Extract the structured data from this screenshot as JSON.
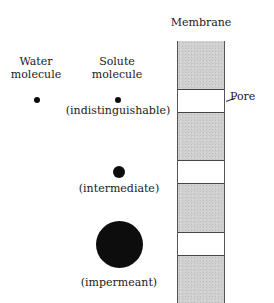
{
  "labels": {
    "membrane": "Membrane",
    "pore": "Pore",
    "water_line1": "Water",
    "water_line2": "molecule",
    "solute_line1": "Solute",
    "solute_line2": "molecule",
    "indistinguishable": "(indistinguishable)",
    "intermediate": "(intermediate)",
    "impermeant": "(impermeant)"
  },
  "molecules": [
    {
      "name": "water-molecule",
      "diameter_px": 6
    },
    {
      "name": "solute-indistinguishable",
      "diameter_px": 6
    },
    {
      "name": "solute-intermediate",
      "diameter_px": 12
    },
    {
      "name": "solute-impermeant",
      "diameter_px": 47
    }
  ],
  "membrane_segments": [
    "gray",
    "pore",
    "gray",
    "pore",
    "gray",
    "pore",
    "gray"
  ],
  "colors": {
    "membrane_fill": "#cfcfcf",
    "pore_fill": "#ffffff",
    "molecule": "#0d0d0d"
  }
}
